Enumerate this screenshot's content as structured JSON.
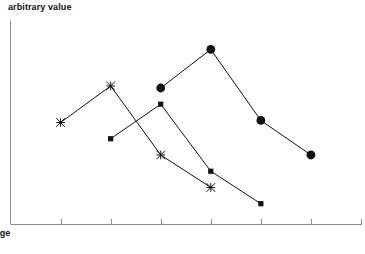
{
  "chart_data": {
    "type": "line",
    "title": "",
    "xlabel": "age",
    "ylabel": "arbitrary value",
    "grid": false,
    "legend": "none",
    "xlim": [
      0,
      7
    ],
    "ylim": [
      0,
      100
    ],
    "x_ticks": [
      1,
      2,
      3,
      4,
      5,
      6,
      7
    ],
    "x_tick_labels": [
      "",
      "",
      "",
      "",
      "",
      "",
      ""
    ],
    "y_ticks": [],
    "y_tick_labels": [],
    "series": [
      {
        "name": "star-series",
        "marker": "asterisk",
        "color": "#111111",
        "x": [
          1,
          2,
          3,
          4
        ],
        "values": [
          50,
          68,
          34,
          18
        ]
      },
      {
        "name": "square-series",
        "marker": "square",
        "color": "#111111",
        "x": [
          2,
          3,
          4,
          5
        ],
        "values": [
          42,
          59,
          26,
          10
        ]
      },
      {
        "name": "circle-series",
        "marker": "circle",
        "color": "#111111",
        "x": [
          3,
          4,
          5,
          6
        ],
        "values": [
          67,
          86,
          51,
          34
        ]
      }
    ]
  },
  "axis": {
    "y_label": "arbitrary value",
    "x_label": "age"
  },
  "caption": {
    "clipped_text": ""
  }
}
